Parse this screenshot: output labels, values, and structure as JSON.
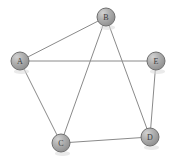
{
  "figure": {
    "type": "graph-diagram",
    "title": "",
    "background_color": "#ffffff",
    "width": 174,
    "height": 162
  },
  "style": {
    "node_fill": "#a9a9a9",
    "node_highlight": "#cfcfcf",
    "node_shade": "#8d8d8d",
    "node_stroke": "#6f6f6f",
    "node_radius": 9,
    "label_color": "#3a3a3a",
    "edge_color": "#8a8a8a",
    "edge_width": 1
  },
  "graph": {
    "directed": false,
    "nodes": [
      {
        "id": "A",
        "label": "A",
        "x": 20,
        "y": 61
      },
      {
        "id": "B",
        "label": "B",
        "x": 106,
        "y": 17
      },
      {
        "id": "C",
        "label": "C",
        "x": 61,
        "y": 143
      },
      {
        "id": "D",
        "label": "D",
        "x": 150,
        "y": 137
      },
      {
        "id": "E",
        "label": "E",
        "x": 156,
        "y": 61
      }
    ],
    "edges": [
      {
        "id": "A-B",
        "source": "A",
        "target": "B"
      },
      {
        "id": "A-E",
        "source": "A",
        "target": "E"
      },
      {
        "id": "A-C",
        "source": "A",
        "target": "C"
      },
      {
        "id": "B-C",
        "source": "B",
        "target": "C"
      },
      {
        "id": "B-D",
        "source": "B",
        "target": "D"
      },
      {
        "id": "C-D",
        "source": "C",
        "target": "D"
      },
      {
        "id": "D-E",
        "source": "D",
        "target": "E"
      }
    ]
  }
}
